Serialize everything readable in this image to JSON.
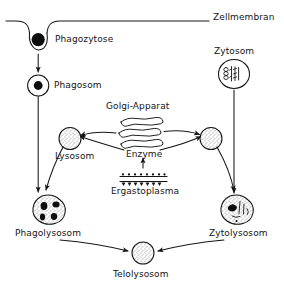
{
  "diagram": {
    "style": "hand-drawn line diagram, black ink on white",
    "labels": {
      "zellmembran": "Zellmembran",
      "phagozytose": "Phagozytose",
      "phagosom": "Phagosom",
      "zytosom": "Zytosom",
      "golgi": "Golgi-Apparat",
      "enzyme": "Enzyme",
      "ergastoplasma": "Ergastoplasma",
      "lysosom": "Lysosom",
      "phagolysosom": "Phagolysosom",
      "zytolysosom": "Zytolysosom",
      "telolysosom": "Telolysosom"
    },
    "nodes": [
      {
        "id": "zellmembran",
        "label": "Zellmembran",
        "shape": "membrane-line",
        "x": 215,
        "y": 18
      },
      {
        "id": "phagozytose",
        "label": "Phagozytose",
        "shape": "invagination-vesicle",
        "x": 58,
        "y": 31
      },
      {
        "id": "phagosom",
        "label": "Phagosom",
        "shape": "circle-dark-core",
        "x": 70,
        "y": 85
      },
      {
        "id": "zytosom",
        "label": "Zytosom",
        "shape": "circle-organelles",
        "x": 234,
        "y": 50
      },
      {
        "id": "golgi",
        "label": "Golgi-Apparat",
        "shape": "golgi-stack",
        "x": 143,
        "y": 106
      },
      {
        "id": "enzyme",
        "label": "Enzyme",
        "shape": "text-arrow",
        "x": 143,
        "y": 156
      },
      {
        "id": "ergastoplasma",
        "label": "Ergastoplasma",
        "shape": "rer-ribosomes",
        "x": 143,
        "y": 190
      },
      {
        "id": "lysosom-left",
        "label": "Lysosom",
        "shape": "stippled-circle",
        "x": 77,
        "y": 138
      },
      {
        "id": "lysosom-right",
        "label": "",
        "shape": "stippled-circle",
        "x": 208,
        "y": 138
      },
      {
        "id": "phagolysosom",
        "label": "Phagolysosom",
        "shape": "blob-dark-inclusions",
        "x": 48,
        "y": 205
      },
      {
        "id": "zytolysosom",
        "label": "Zytolysosom",
        "shape": "blob-organelles",
        "x": 236,
        "y": 205
      },
      {
        "id": "telolysosom",
        "label": "Telolysosom",
        "shape": "stippled-circle",
        "x": 143,
        "y": 257
      }
    ],
    "edges": [
      {
        "from": "phagozytose",
        "to": "phagosom",
        "type": "arrow-straight"
      },
      {
        "from": "phagosom",
        "to": "phagolysosom",
        "type": "arrow-straight"
      },
      {
        "from": "zytosom",
        "to": "zytolysosom",
        "type": "arrow-straight"
      },
      {
        "from": "golgi",
        "to": "lysosom-left",
        "type": "arrow-curved"
      },
      {
        "from": "golgi",
        "to": "lysosom-right",
        "type": "arrow-curved"
      },
      {
        "from": "ergastoplasma",
        "to": "enzyme",
        "type": "arrow-straight"
      },
      {
        "from": "lysosom-left",
        "to": "phagolysosom",
        "type": "arrow-curved"
      },
      {
        "from": "lysosom-right",
        "to": "zytolysosom",
        "type": "arrow-curved"
      },
      {
        "from": "phagolysosom",
        "to": "telolysosom",
        "type": "arrow-curved"
      },
      {
        "from": "zytolysosom",
        "to": "telolysosom",
        "type": "arrow-curved"
      }
    ],
    "colors": {
      "ink": "#151515",
      "paper": "#ffffff",
      "fill_dark": "#0d0d0d"
    }
  }
}
